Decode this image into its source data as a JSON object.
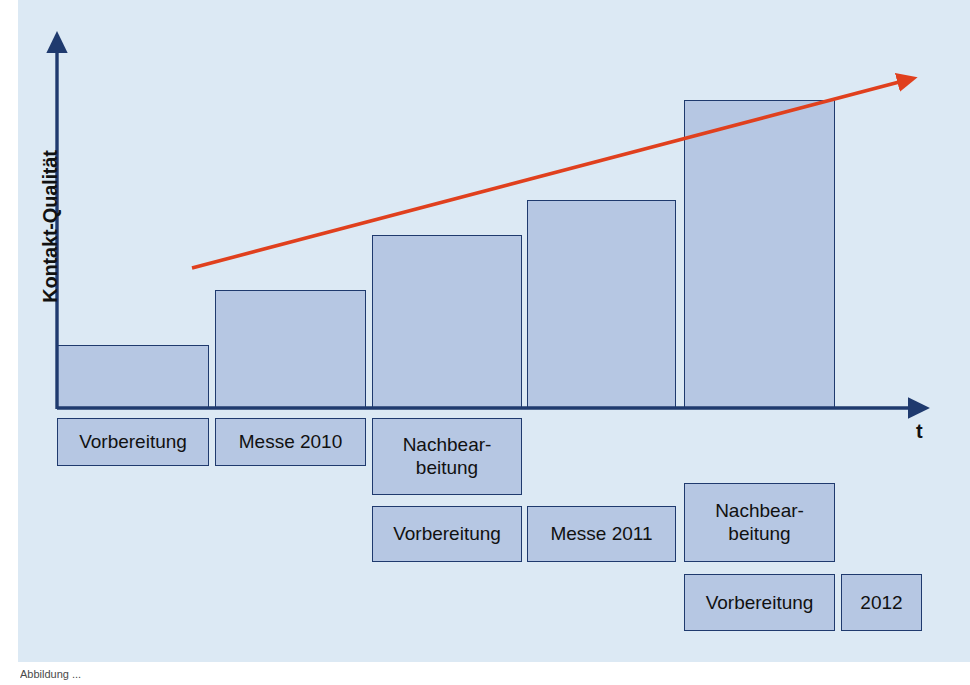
{
  "figure": {
    "background_color": "#dce9f4",
    "bar_fill_color": "#b6c7e3",
    "bar_border_color": "#1f3a6e",
    "axis_color": "#1f3a6e",
    "trend_arrow_color": "#e0401e",
    "caption": "Abbildung ..."
  },
  "axes": {
    "y_label": "Kontakt-Qualität",
    "x_label": "t"
  },
  "chart_data": {
    "type": "bar",
    "title": "",
    "xlabel": "t",
    "ylabel": "Kontakt-Qualität",
    "grid": false,
    "legend": "none",
    "categories": [
      "Vorbereitung 2010",
      "Messe 2010",
      "Nachbearbeitung 2010 / Vorbereitung 2011",
      "Messe 2011",
      "Nachbearbeitung 2011 / Vorbereitung 2012"
    ],
    "values": [
      1,
      2,
      3,
      4,
      5
    ],
    "value_note": "relative, unlabeled ordinal heights read off bar tops",
    "bar_pixel_tops": [
      345,
      290,
      235,
      200,
      100
    ],
    "baseline_pixel_y": 408,
    "annotations": [
      {
        "type": "trend-arrow",
        "label": "steigende Kontakt-Qualität",
        "color": "#e0401e",
        "from": [
          192,
          268
        ],
        "to": [
          912,
          78
        ]
      }
    ]
  },
  "bars": [
    {
      "name": "bar-vorbereitung-2010",
      "x": 57,
      "y": 345,
      "w": 152,
      "h": 63
    },
    {
      "name": "bar-messe-2010",
      "x": 215,
      "y": 290,
      "w": 151,
      "h": 118
    },
    {
      "name": "bar-nachbearbeitung-2010",
      "x": 372,
      "y": 235,
      "w": 150,
      "h": 173
    },
    {
      "name": "bar-messe-2011",
      "x": 527,
      "y": 200,
      "w": 149,
      "h": 208
    },
    {
      "name": "bar-nachbearbeitung-2011",
      "x": 684,
      "y": 100,
      "w": 151,
      "h": 308
    }
  ],
  "phase_rows": [
    {
      "row": 1,
      "boxes": [
        {
          "name": "phase-box-vorbereitung-2010",
          "label": "Vorbereitung",
          "lines": [
            "Vorbereitung"
          ],
          "x": 57,
          "y": 418,
          "w": 152,
          "h": 48
        },
        {
          "name": "phase-box-messe-2010",
          "label": "Messe 2010",
          "lines": [
            "Messe 2010"
          ],
          "x": 215,
          "y": 418,
          "w": 151,
          "h": 48
        },
        {
          "name": "phase-box-nachbearbeitung-2010",
          "label": "Nachbear-beitung",
          "lines": [
            "Nachbear-",
            "beitung"
          ],
          "x": 372,
          "y": 418,
          "w": 150,
          "h": 77
        }
      ]
    },
    {
      "row": 2,
      "boxes": [
        {
          "name": "phase-box-vorbereitung-2011",
          "label": "Vorbereitung",
          "lines": [
            "Vorbereitung"
          ],
          "x": 372,
          "y": 506,
          "w": 150,
          "h": 56
        },
        {
          "name": "phase-box-messe-2011",
          "label": "Messe 2011",
          "lines": [
            "Messe 2011"
          ],
          "x": 527,
          "y": 506,
          "w": 149,
          "h": 56
        },
        {
          "name": "phase-box-nachbearbeitung-2011",
          "label": "Nachbear-beitung",
          "lines": [
            "Nachbear-",
            "beitung"
          ],
          "x": 684,
          "y": 483,
          "w": 151,
          "h": 79
        }
      ]
    },
    {
      "row": 3,
      "boxes": [
        {
          "name": "phase-box-vorbereitung-2012",
          "label": "Vorbereitung",
          "lines": [
            "Vorbereitung"
          ],
          "x": 684,
          "y": 574,
          "w": 151,
          "h": 57
        },
        {
          "name": "phase-box-jahr-2012",
          "label": "2012",
          "lines": [
            "2012"
          ],
          "x": 841,
          "y": 574,
          "w": 81,
          "h": 57
        }
      ]
    }
  ]
}
